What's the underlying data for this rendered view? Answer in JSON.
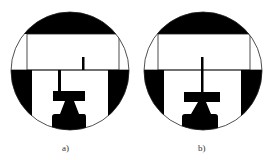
{
  "figures": [
    {
      "id": "a",
      "caption": "a)",
      "center_x": 70,
      "variant": "offset-stem",
      "description": "Circular view: black top cap, white rectangle, black side bands, short tick in upper rectangle offset from lower stem, T-bar and pedestal"
    },
    {
      "id": "b",
      "caption": "b)",
      "center_x": 203,
      "variant": "aligned-stem",
      "description": "Circular view: black top cap, white rectangle, black side bands, single continuous stem aligned through line, T-bar and pedestal"
    }
  ],
  "colors": {
    "ink": "#000000",
    "background": "#ffffff",
    "line": "#333333"
  }
}
